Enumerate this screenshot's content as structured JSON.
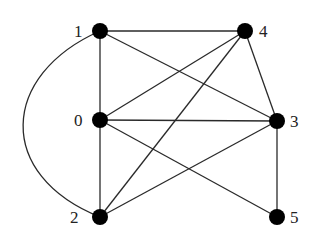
{
  "graph": {
    "nodes": [
      {
        "id": "0",
        "label": "0",
        "x": 100,
        "y": 120,
        "lx": 78,
        "ly": 126
      },
      {
        "id": "1",
        "label": "1",
        "x": 100,
        "y": 31,
        "lx": 78,
        "ly": 37
      },
      {
        "id": "2",
        "label": "2",
        "x": 100,
        "y": 217,
        "lx": 70,
        "ly": 223
      },
      {
        "id": "3",
        "label": "3",
        "x": 277,
        "y": 121,
        "lx": 291,
        "ly": 127
      },
      {
        "id": "4",
        "label": "4",
        "x": 245,
        "y": 31,
        "lx": 260,
        "ly": 37
      },
      {
        "id": "5",
        "label": "5",
        "x": 277,
        "y": 217,
        "lx": 291,
        "ly": 223
      }
    ],
    "edges": [
      [
        "1",
        "4"
      ],
      [
        "1",
        "0"
      ],
      [
        "1",
        "3"
      ],
      [
        "1",
        "2"
      ],
      [
        "0",
        "4"
      ],
      [
        "0",
        "3"
      ],
      [
        "0",
        "2"
      ],
      [
        "0",
        "5"
      ],
      [
        "2",
        "4"
      ],
      [
        "2",
        "3"
      ],
      [
        "4",
        "3"
      ],
      [
        "3",
        "5"
      ]
    ],
    "curved_edges": [
      [
        "1",
        "2"
      ]
    ]
  }
}
